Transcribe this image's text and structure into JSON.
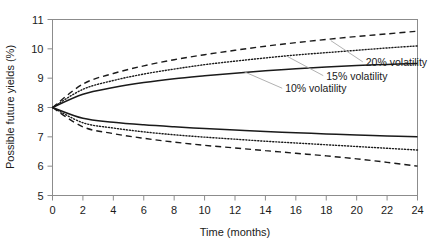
{
  "chart_data": {
    "type": "line",
    "title": "",
    "subtitle": "",
    "xlabel": "Time (months)",
    "ylabel": "Possible future yields (%)",
    "xlim": [
      0,
      24
    ],
    "ylim": [
      5,
      11
    ],
    "xticks": [
      0,
      2,
      4,
      6,
      8,
      10,
      12,
      14,
      16,
      18,
      20,
      22,
      24
    ],
    "yticks": [
      5,
      6,
      7,
      8,
      9,
      10,
      11
    ],
    "xtick_labels": [
      "0",
      "2",
      "4",
      "6",
      "8",
      "10",
      "12",
      "14",
      "16",
      "18",
      "20",
      "22",
      "24"
    ],
    "ytick_labels": [
      "5",
      "6",
      "7",
      "8",
      "9",
      "10",
      "11"
    ],
    "grid": false,
    "legend_position": "inline-annotations",
    "start_value": 8,
    "x": [
      0,
      2,
      4,
      6,
      8,
      10,
      12,
      14,
      16,
      18,
      20,
      22,
      24
    ],
    "series": [
      {
        "name": "10% volatility upper",
        "style": "solid",
        "values": [
          8.0,
          8.45,
          8.68,
          8.85,
          8.98,
          9.08,
          9.17,
          9.25,
          9.32,
          9.38,
          9.43,
          9.47,
          9.5
        ]
      },
      {
        "name": "10% volatility lower",
        "style": "solid",
        "values": [
          8.0,
          7.63,
          7.5,
          7.41,
          7.34,
          7.28,
          7.23,
          7.18,
          7.14,
          7.1,
          7.06,
          7.03,
          7.0
        ]
      },
      {
        "name": "15% volatility upper",
        "style": "dotted",
        "values": [
          8.0,
          8.62,
          8.92,
          9.14,
          9.31,
          9.46,
          9.58,
          9.69,
          9.79,
          9.87,
          9.95,
          10.03,
          10.1
        ]
      },
      {
        "name": "15% volatility lower",
        "style": "dotted",
        "values": [
          8.0,
          7.48,
          7.3,
          7.17,
          7.07,
          6.99,
          6.92,
          6.85,
          6.79,
          6.73,
          6.67,
          6.61,
          6.55
        ]
      },
      {
        "name": "20% volatility upper",
        "style": "dashed",
        "values": [
          8.0,
          8.8,
          9.16,
          9.42,
          9.63,
          9.8,
          9.95,
          10.09,
          10.21,
          10.32,
          10.42,
          10.51,
          10.6
        ]
      },
      {
        "name": "20% volatility lower",
        "style": "dashed",
        "values": [
          8.0,
          7.34,
          7.11,
          6.95,
          6.82,
          6.71,
          6.62,
          6.53,
          6.44,
          6.35,
          6.25,
          6.13,
          6.0
        ]
      }
    ],
    "annotations": [
      {
        "text": "20% volatility",
        "label_x": 20.6,
        "label_y": 9.42,
        "leader_to_x": 18.3,
        "leader_to_y": 10.28,
        "series": "20% volatility upper"
      },
      {
        "text": "15% volatility",
        "label_x": 18.0,
        "label_y": 8.95,
        "leader_to_x": 15.3,
        "leader_to_y": 9.78,
        "series": "15% volatility upper"
      },
      {
        "text": "10% volatility",
        "label_x": 15.3,
        "label_y": 8.52,
        "leader_to_x": 12.6,
        "leader_to_y": 9.22,
        "series": "10% volatility upper"
      }
    ],
    "colors": {
      "line": "#1a1a1a",
      "axis": "#8c8c8c",
      "leader": "#a8a8a8",
      "text": "#1a1a1a",
      "background": "#ffffff"
    }
  }
}
